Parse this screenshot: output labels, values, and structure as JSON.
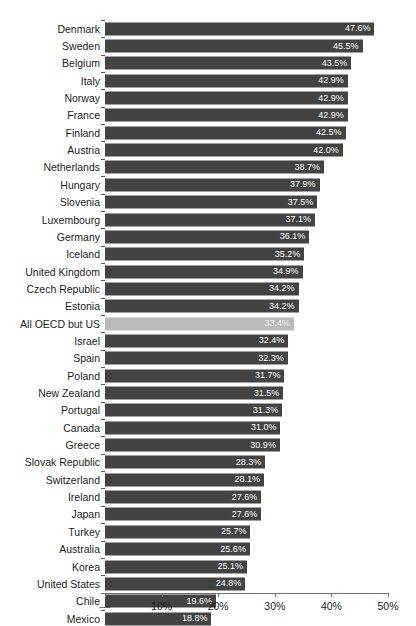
{
  "chart_data": {
    "type": "bar",
    "orientation": "horizontal",
    "title": "",
    "xlabel": "",
    "ylabel": "",
    "xlim": [
      0,
      50
    ],
    "grid": false,
    "legend": null,
    "tick_labels": [
      "—",
      "10%",
      "20%",
      "30%",
      "40%",
      "50%"
    ],
    "tick_values": [
      0,
      10,
      20,
      30,
      40,
      50
    ],
    "value_suffix": "%",
    "colors": {
      "bar": "#434343",
      "bar_highlight": "#b9b9b9",
      "value_text": "#ffffff",
      "axis": "#6e6e6e",
      "label_text": "#1c1c1c",
      "background": "#ffffff"
    },
    "highlight_category": "All OECD but US",
    "categories": [
      "Denmark",
      "Sweden",
      "Belgium",
      "Italy",
      "Norway",
      "France",
      "Finland",
      "Austria",
      "Netherlands",
      "Hungary",
      "Slovenia",
      "Luxembourg",
      "Germany",
      "Iceland",
      "United Kingdom",
      "Czech Republic",
      "Estonia",
      "All OECD but US",
      "Israel",
      "Spain",
      "Poland",
      "New Zealand",
      "Portugal",
      "Canada",
      "Greece",
      "Slovak Republic",
      "Switzerland",
      "Ireland",
      "Japan",
      "Turkey",
      "Australia",
      "Korea",
      "United States",
      "Chile",
      "Mexico"
    ],
    "values": [
      47.6,
      45.5,
      43.5,
      42.9,
      42.9,
      42.9,
      42.5,
      42.0,
      38.7,
      37.9,
      37.5,
      37.1,
      36.1,
      35.2,
      34.9,
      34.2,
      34.2,
      33.4,
      32.4,
      32.3,
      31.7,
      31.5,
      31.3,
      31.0,
      30.9,
      28.3,
      28.1,
      27.6,
      27.6,
      25.7,
      25.6,
      25.1,
      24.8,
      19.6,
      18.8
    ],
    "value_labels": [
      "47.6%",
      "45.5%",
      "43.5%",
      "42.9%",
      "42.9%",
      "42.9%",
      "42.5%",
      "42.0%",
      "38.7%",
      "37.9%",
      "37.5%",
      "37.1%",
      "36.1%",
      "35.2%",
      "34.9%",
      "34.2%",
      "34.2%",
      "33.4%",
      "32.4%",
      "32.3%",
      "31.7%",
      "31.5%",
      "31.3%",
      "31.0%",
      "30.9%",
      "28.3%",
      "28.1%",
      "27.6%",
      "27.6%",
      "25.7%",
      "25.6%",
      "25.1%",
      "24.8%",
      "19.6%",
      "18.8%"
    ]
  }
}
